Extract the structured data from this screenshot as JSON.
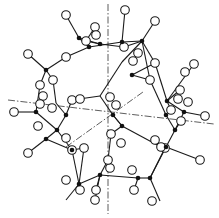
{
  "figure": {
    "title": "",
    "colors": {
      "background": "#ffffff",
      "ink": "#1a1a1a"
    },
    "axes": [
      {
        "name": "vertical-axis",
        "x1": 108,
        "y1": 4,
        "x2": 108,
        "y2": 214
      },
      {
        "name": "horizontal-axis",
        "x1": 8,
        "y1": 100,
        "x2": 214,
        "y2": 124
      },
      {
        "name": "diagonal-axis",
        "x1": 66,
        "y1": 147,
        "x2": 143,
        "y2": 92
      }
    ],
    "black_atoms": [
      [
        79,
        38
      ],
      [
        122,
        42
      ],
      [
        142,
        41
      ],
      [
        100,
        44
      ],
      [
        46,
        70
      ],
      [
        132,
        75
      ],
      [
        66,
        115
      ],
      [
        36,
        112
      ],
      [
        57,
        130
      ],
      [
        46,
        139
      ],
      [
        167,
        101
      ],
      [
        184,
        112
      ],
      [
        175,
        130
      ],
      [
        166,
        147
      ],
      [
        79,
        184
      ],
      [
        100,
        175
      ],
      [
        138,
        178
      ],
      [
        113,
        115
      ],
      [
        122,
        126
      ],
      [
        89,
        47
      ],
      [
        72,
        150
      ],
      [
        166,
        115
      ],
      [
        150,
        178
      ]
    ],
    "open_atoms": [
      [
        66,
        15
      ],
      [
        125,
        10
      ],
      [
        155,
        21
      ],
      [
        28,
        54
      ],
      [
        66,
        57
      ],
      [
        95,
        27
      ],
      [
        96,
        35
      ],
      [
        86,
        41
      ],
      [
        124,
        47
      ],
      [
        138,
        53
      ],
      [
        133,
        61
      ],
      [
        110,
        97
      ],
      [
        116,
        105
      ],
      [
        155,
        63
      ],
      [
        194,
        64
      ],
      [
        150,
        80
      ],
      [
        14,
        112
      ],
      [
        40,
        85
      ],
      [
        53,
        80
      ],
      [
        43,
        96
      ],
      [
        40,
        104
      ],
      [
        52,
        108
      ],
      [
        72,
        100
      ],
      [
        80,
        99
      ],
      [
        84,
        148
      ],
      [
        110,
        168
      ],
      [
        165,
        148
      ],
      [
        200,
        160
      ],
      [
        181,
        121
      ],
      [
        178,
        99
      ],
      [
        188,
        102
      ],
      [
        171,
        110
      ],
      [
        180,
        90
      ],
      [
        185,
        72
      ],
      [
        205,
        116
      ],
      [
        38,
        126
      ],
      [
        28,
        153
      ],
      [
        66,
        138
      ],
      [
        66,
        180
      ],
      [
        95,
        200
      ],
      [
        72,
        150
      ],
      [
        80,
        190
      ],
      [
        96,
        190
      ],
      [
        134,
        190
      ],
      [
        152,
        201
      ],
      [
        111,
        134
      ],
      [
        121,
        143
      ],
      [
        132,
        170
      ],
      [
        155,
        140
      ],
      [
        161,
        147
      ],
      [
        108,
        160
      ]
    ],
    "bonds": [
      [
        66,
        15,
        79,
        38
      ],
      [
        79,
        38,
        89,
        47
      ],
      [
        79,
        38,
        100,
        44
      ],
      [
        89,
        47,
        122,
        42
      ],
      [
        122,
        42,
        125,
        10
      ],
      [
        122,
        42,
        142,
        41
      ],
      [
        142,
        41,
        155,
        21
      ],
      [
        100,
        44,
        124,
        47
      ],
      [
        124,
        47,
        142,
        41
      ],
      [
        142,
        41,
        150,
        80
      ],
      [
        100,
        44,
        86,
        41
      ],
      [
        86,
        41,
        95,
        27
      ],
      [
        89,
        47,
        66,
        57
      ],
      [
        66,
        57,
        46,
        70
      ],
      [
        46,
        70,
        28,
        54
      ],
      [
        46,
        70,
        40,
        85
      ],
      [
        46,
        70,
        53,
        80
      ],
      [
        53,
        80,
        56,
        103
      ],
      [
        40,
        85,
        36,
        112
      ],
      [
        36,
        112,
        14,
        112
      ],
      [
        36,
        112,
        57,
        130
      ],
      [
        56,
        103,
        66,
        115
      ],
      [
        66,
        115,
        72,
        100
      ],
      [
        72,
        100,
        100,
        96
      ],
      [
        100,
        96,
        122,
        62
      ],
      [
        122,
        62,
        142,
        41
      ],
      [
        66,
        115,
        57,
        130
      ],
      [
        57,
        130,
        46,
        139
      ],
      [
        46,
        139,
        28,
        153
      ],
      [
        46,
        139,
        72,
        150
      ],
      [
        57,
        130,
        72,
        150
      ],
      [
        72,
        150,
        84,
        148
      ],
      [
        84,
        148,
        79,
        184
      ],
      [
        72,
        150,
        79,
        184
      ],
      [
        79,
        184,
        66,
        200
      ],
      [
        79,
        184,
        100,
        175
      ],
      [
        100,
        175,
        138,
        178
      ],
      [
        138,
        178,
        150,
        178
      ],
      [
        150,
        178,
        165,
        148
      ],
      [
        150,
        178,
        160,
        201
      ],
      [
        100,
        175,
        96,
        190
      ],
      [
        138,
        178,
        134,
        190
      ],
      [
        100,
        175,
        95,
        200
      ],
      [
        166,
        147,
        150,
        178
      ],
      [
        166,
        147,
        165,
        148
      ],
      [
        166,
        147,
        200,
        160
      ],
      [
        166,
        147,
        175,
        130
      ],
      [
        175,
        130,
        181,
        121
      ],
      [
        175,
        130,
        184,
        112
      ],
      [
        184,
        112,
        205,
        116
      ],
      [
        184,
        112,
        167,
        101
      ],
      [
        167,
        101,
        180,
        90
      ],
      [
        167,
        101,
        194,
        64
      ],
      [
        167,
        101,
        155,
        63
      ],
      [
        155,
        63,
        142,
        41
      ],
      [
        167,
        101,
        171,
        110
      ],
      [
        113,
        115,
        122,
        126
      ],
      [
        113,
        115,
        100,
        96
      ],
      [
        122,
        126,
        161,
        147
      ],
      [
        113,
        115,
        122,
        126
      ],
      [
        122,
        126,
        111,
        134
      ],
      [
        111,
        134,
        108,
        160
      ],
      [
        108,
        160,
        100,
        175
      ],
      [
        166,
        115,
        175,
        130
      ],
      [
        166,
        115,
        150,
        80
      ],
      [
        132,
        75,
        150,
        80
      ],
      [
        132,
        75,
        155,
        63
      ]
    ]
  }
}
